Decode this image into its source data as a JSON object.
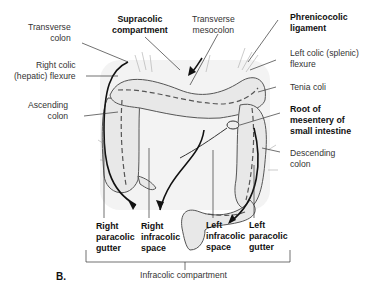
{
  "figure": {
    "panel_label": "B.",
    "labels": {
      "transverse_colon": "Transverse\ncolon",
      "supracolic_compartment": "Supracolic\ncompartment",
      "transverse_mesocolon": "Transverse\nmesocolon",
      "phrenicocolic_ligament": "Phrenicocolic\nligament",
      "left_colic_flexure": "Left colic (splenic)\nflexure",
      "right_colic_flexure": "Right colic\n(hepatic) flexure",
      "tenia_coli": "Tenia coli",
      "ascending_colon": "Ascending\ncolon",
      "root_of_mesentery": "Root of\nmesentery of\nsmall intestine",
      "descending_colon": "Descending\ncolon",
      "right_paracolic_gutter": "Right\nparacolic\ngutter",
      "right_infracolic_space": "Right\ninfracolic\nspace",
      "left_infracolic_space": "Left\ninfracolic\nspace",
      "left_paracolic_gutter": "Left\nparacolic\ngutter",
      "infracolic_compartment": "Infracolic compartment"
    },
    "colors": {
      "line": "#333333",
      "organ_fill": "#e8e8e8",
      "organ_stroke": "#555555",
      "background_shade": "#f1f1f1"
    }
  }
}
